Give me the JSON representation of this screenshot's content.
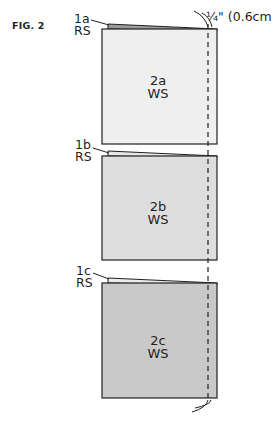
{
  "figure": {
    "label": "FIG. 2",
    "measurement": "¼\" (0.6cm)"
  },
  "colors": {
    "outline": "#231f20",
    "square_2a": "#efefef",
    "square_2b": "#dedede",
    "square_2c": "#c9c9c9",
    "flap_1a": "#9b9b9b",
    "flap_1b": "#e6e6e6",
    "flap_1c": "#ececec"
  },
  "units": [
    {
      "flap": {
        "id": "1a",
        "side": "RS"
      },
      "square": {
        "id": "2a",
        "side": "WS"
      }
    },
    {
      "flap": {
        "id": "1b",
        "side": "RS"
      },
      "square": {
        "id": "2b",
        "side": "WS"
      }
    },
    {
      "flap": {
        "id": "1c",
        "side": "RS"
      },
      "square": {
        "id": "2c",
        "side": "WS"
      }
    }
  ],
  "seam_line": {
    "style": "dashed",
    "allowance": "¼\" (0.6cm)"
  }
}
